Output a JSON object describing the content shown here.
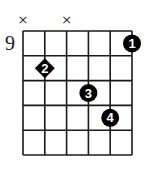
{
  "chord_diagram": {
    "start_fret_label": "9",
    "num_strings": 6,
    "num_frets": 5,
    "colors": {
      "line": "#1a1a1a",
      "dot": "#000000",
      "number": "#ffffff"
    },
    "strings": [
      {
        "string": 1,
        "state": "muted",
        "marker": "×"
      },
      {
        "string": 2,
        "state": "fretted"
      },
      {
        "string": 3,
        "state": "muted",
        "marker": "×"
      },
      {
        "string": 4,
        "state": "fretted"
      },
      {
        "string": 5,
        "state": "fretted"
      },
      {
        "string": 6,
        "state": "fretted"
      }
    ],
    "fingers": [
      {
        "string": 6,
        "fret": 1,
        "finger": "1",
        "shape": "circle"
      },
      {
        "string": 2,
        "fret": 2,
        "finger": "2",
        "shape": "diamond"
      },
      {
        "string": 4,
        "fret": 3,
        "finger": "3",
        "shape": "circle"
      },
      {
        "string": 5,
        "fret": 4,
        "finger": "4",
        "shape": "circle"
      }
    ]
  }
}
